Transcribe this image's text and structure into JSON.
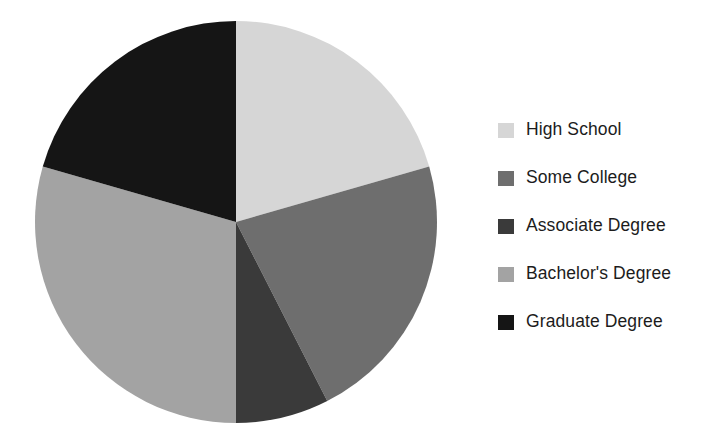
{
  "chart_data": {
    "type": "pie",
    "title": "",
    "subtitle": "",
    "xlabel": "",
    "ylabel": "",
    "legend_position": "right",
    "grid": false,
    "start_angle_deg": 0,
    "direction": "clockwise",
    "categories": [
      "High School",
      "Some College",
      "Associate Degree",
      "Bachelor's Degree",
      "Graduate Degree"
    ],
    "values": [
      20.5,
      22.0,
      7.5,
      29.5,
      20.5
    ],
    "units": "percent",
    "slices": [
      {
        "label": "High School",
        "value": 20.5,
        "color": "#d6d6d6",
        "start_deg": 0,
        "end_deg": 74
      },
      {
        "label": "Some College",
        "value": 22.0,
        "color": "#6e6e6e",
        "start_deg": 74,
        "end_deg": 153
      },
      {
        "label": "Associate Degree",
        "value": 7.5,
        "color": "#3a3a3a",
        "start_deg": 153,
        "end_deg": 180
      },
      {
        "label": "Bachelor's Degree",
        "value": 29.5,
        "color": "#a3a3a3",
        "start_deg": 180,
        "end_deg": 286
      },
      {
        "label": "Graduate Degree",
        "value": 20.5,
        "color": "#151515",
        "start_deg": 286,
        "end_deg": 360
      }
    ]
  },
  "legend": {
    "items": [
      {
        "label": "High School",
        "color": "#d6d6d6"
      },
      {
        "label": "Some College",
        "color": "#6e6e6e"
      },
      {
        "label": "Associate Degree",
        "color": "#3a3a3a"
      },
      {
        "label": "Bachelor's Degree",
        "color": "#a3a3a3"
      },
      {
        "label": "Graduate Degree",
        "color": "#151515"
      }
    ]
  },
  "canvas": {
    "background": "#ffffff",
    "center_x": 236,
    "center_y": 222,
    "radius": 201
  }
}
